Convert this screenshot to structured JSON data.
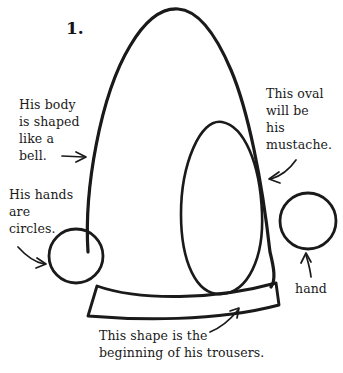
{
  "page": {
    "background_color": "#ffffff",
    "ink_color": "#1a1a1a",
    "width": 343,
    "height": 373
  },
  "step": {
    "number_label": "1."
  },
  "annotations": [
    {
      "id": "body",
      "lines": [
        "His body",
        "is shaped",
        "like a",
        "bell."
      ],
      "text": "His body\nis shaped\nlike a\nbell.",
      "arrow": "straight-right-arrow",
      "points_to": "bell-body-shape"
    },
    {
      "id": "hands",
      "lines": [
        "His hands",
        "are",
        "circles."
      ],
      "text": "His hands\nare\ncircles.",
      "arrow": "curved-down-right-arrow",
      "points_to": "left-hand-circle"
    },
    {
      "id": "mustache",
      "lines": [
        "This oval",
        "will be",
        "his",
        "mustache."
      ],
      "text": "This oval\nwill be\nhis\nmustache.",
      "arrow": "curved-down-left-arrow",
      "points_to": "mustache-oval"
    },
    {
      "id": "trousers",
      "lines": [
        "This shape is the",
        "beginning of his trousers."
      ],
      "text": "This shape is the\nbeginning of his trousers.",
      "arrow": "curved-up-right-arrow",
      "points_to": "trousers-shape"
    },
    {
      "id": "hand",
      "lines": [
        "hand"
      ],
      "text": "hand",
      "arrow": "straight-up-arrow",
      "points_to": "right-hand-circle"
    }
  ],
  "drawing": {
    "shapes": [
      {
        "name": "bell-body-shape",
        "kind": "bell-outline"
      },
      {
        "name": "mustache-oval",
        "kind": "egg-oval"
      },
      {
        "name": "left-hand-circle",
        "kind": "circle"
      },
      {
        "name": "right-hand-circle",
        "kind": "circle"
      },
      {
        "name": "trousers-shape",
        "kind": "curved-band"
      }
    ]
  }
}
